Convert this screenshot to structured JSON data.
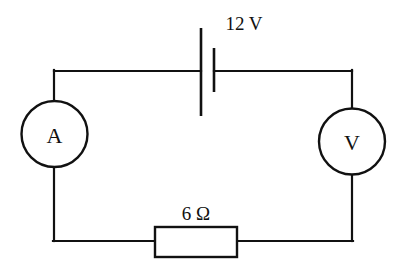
{
  "diagram": {
    "background_color": "#ffffff",
    "line_color": "#111111",
    "canvas": {
      "width": 405,
      "height": 269
    }
  },
  "components": {
    "battery": {
      "name": "battery",
      "label": "12 V",
      "value": "12",
      "unit": "V",
      "quantity": "voltage",
      "long_plate_x": 201,
      "short_plate_x": 214
    },
    "resistor": {
      "name": "resistor",
      "label": "6 Ω",
      "value": "6",
      "unit": "Ω",
      "quantity": "resistance",
      "x": 155,
      "y": 227,
      "width": 82,
      "height": 30
    },
    "ammeter": {
      "name": "ammeter",
      "label": "A",
      "cx": 54.5,
      "cy": 134,
      "r": 33
    },
    "voltmeter": {
      "name": "voltmeter",
      "label": "V",
      "cx": 352,
      "cy": 141.5,
      "r": 33
    }
  },
  "layout": {
    "left_rail_x": 54,
    "right_rail_x": 352,
    "top_wire_y": 71,
    "bottom_wire_y": 241
  }
}
